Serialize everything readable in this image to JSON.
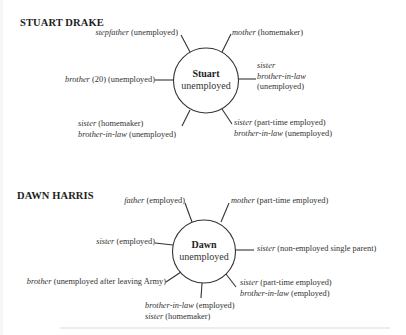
{
  "diagrams": [
    {
      "title": "STUART DRAKE",
      "center": {
        "name": "Stuart",
        "status": "unemployed"
      },
      "relations": [
        {
          "lines": [
            {
              "rel": "stepfather",
              "desc": " (unemployed)"
            }
          ]
        },
        {
          "lines": [
            {
              "rel": "mother",
              "desc": " (homemaker)"
            }
          ]
        },
        {
          "lines": [
            {
              "rel": "brother",
              "desc": " (20) (unemployed)"
            }
          ]
        },
        {
          "lines": [
            {
              "rel": "sister",
              "desc": ""
            },
            {
              "rel": "brother-in-law",
              "desc": ""
            },
            {
              "rel": "",
              "desc": "(unemployed)"
            }
          ]
        },
        {
          "lines": [
            {
              "rel": "sister",
              "desc": " (homemaker)"
            },
            {
              "rel": "brother-in-law",
              "desc": " (unemployed)"
            }
          ]
        },
        {
          "lines": [
            {
              "rel": "sister",
              "desc": " (part-time employed)"
            },
            {
              "rel": "brother-in-law",
              "desc": " (unemployed)"
            }
          ]
        }
      ]
    },
    {
      "title": "DAWN HARRIS",
      "center": {
        "name": "Dawn",
        "status": "unemployed"
      },
      "relations": [
        {
          "lines": [
            {
              "rel": "father",
              "desc": " (employed)"
            }
          ]
        },
        {
          "lines": [
            {
              "rel": "mother",
              "desc": " (part-time employed)"
            }
          ]
        },
        {
          "lines": [
            {
              "rel": "sister",
              "desc": " (employed)"
            }
          ]
        },
        {
          "lines": [
            {
              "rel": "sister",
              "desc": " (non-employed single parent)"
            }
          ]
        },
        {
          "lines": [
            {
              "rel": "brother",
              "desc": " (unemployed after leaving Army)"
            }
          ]
        },
        {
          "lines": [
            {
              "rel": "sister",
              "desc": " (part-time employed)"
            },
            {
              "rel": "brother-in-law",
              "desc": " (employed)"
            }
          ]
        },
        {
          "lines": [
            {
              "rel": "brother-in-law",
              "desc": " (employed)"
            },
            {
              "rel": "sister",
              "desc": " (homemaker)"
            }
          ]
        }
      ]
    }
  ],
  "colors": {
    "ink": "#2a2a2a",
    "background": "#ffffff"
  }
}
